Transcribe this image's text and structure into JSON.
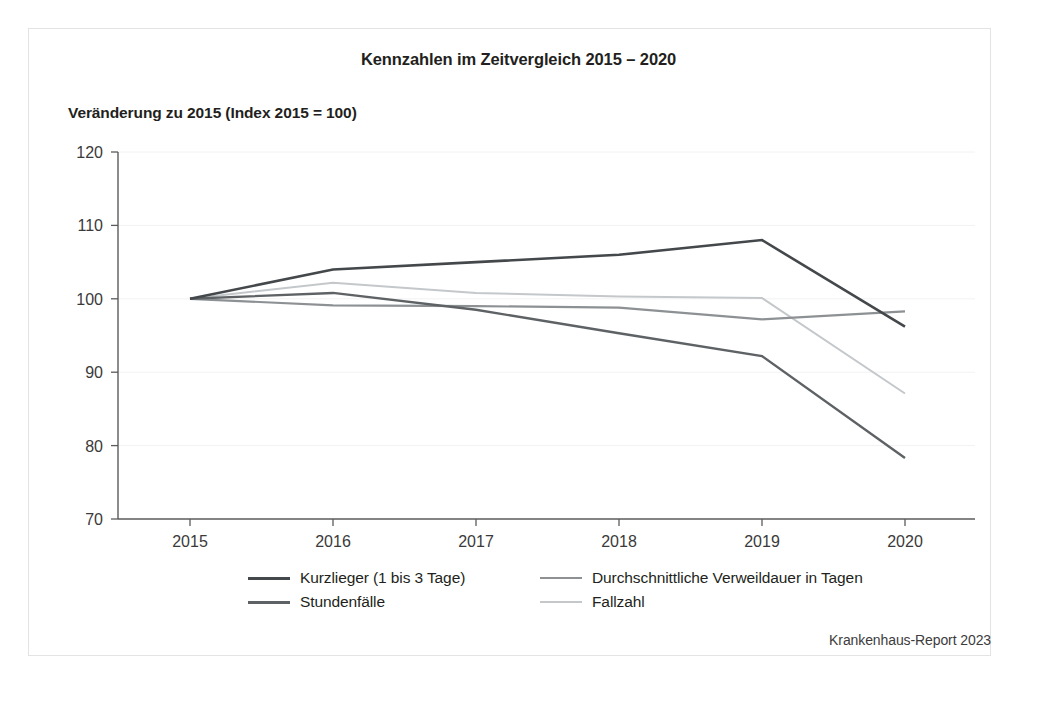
{
  "figure": {
    "title": "Kennzahlen im Zeitvergleich 2015 – 2020",
    "subtitle": "Veränderung zu 2015 (Index 2015 = 100)",
    "source_note": "Krankenhaus-Report 2023"
  },
  "chart_data": {
    "type": "line",
    "title": "Kennzahlen im Zeitvergleich 2015 – 2020",
    "subtitle": "Veränderung zu 2015 (Index 2015 = 100)",
    "xlabel": "",
    "ylabel": "Veränderung zu 2015 (Index 2015 = 100)",
    "x": [
      2015,
      2016,
      2017,
      2018,
      2019,
      2020
    ],
    "categories": [
      "2015",
      "2016",
      "2017",
      "2018",
      "2019",
      "2020"
    ],
    "xtick_labels": [
      "2015",
      "2016",
      "2017",
      "2018",
      "2019",
      "2020"
    ],
    "ytick_labels": [
      "70",
      "80",
      "90",
      "100",
      "110",
      "120"
    ],
    "yticks": [
      70,
      80,
      90,
      100,
      110,
      120
    ],
    "ylim": [
      70,
      120
    ],
    "xlim": [
      2015,
      2020
    ],
    "grid": true,
    "legend_position": "bottom",
    "series": [
      {
        "name": "Kurzlieger (1 bis 3 Tage)",
        "color": "#44484b",
        "width": 2.6,
        "dash": "none",
        "values": [
          100,
          104,
          105,
          106,
          108,
          96.2
        ]
      },
      {
        "name": "Stundenfälle",
        "color": "#5e6265",
        "width": 2.4,
        "dash": "none",
        "values": [
          100,
          100.8,
          98.5,
          95.3,
          92.2,
          78.3
        ]
      },
      {
        "name": "Durchschnittliche Verweildauer in Tagen",
        "color": "#8d9194",
        "width": 2.2,
        "dash": "none",
        "values": [
          100,
          99.1,
          99,
          98.8,
          97.2,
          98.3
        ]
      },
      {
        "name": "Fallzahl",
        "color": "#c4c8cb",
        "width": 2.0,
        "dash": "none",
        "values": [
          100,
          102.2,
          100.8,
          100.3,
          100.1,
          87.1
        ]
      }
    ]
  },
  "legend": {
    "entries": [
      {
        "label": "Kurzlieger (1 bis 3 Tage)",
        "color": "#44484b",
        "width": "3px",
        "column": "left",
        "row": 0
      },
      {
        "label": "Durchschnittliche Verweildauer in Tagen",
        "color": "#8d9194",
        "width": "2.5px",
        "column": "right",
        "row": 0
      },
      {
        "label": "Stundenfälle",
        "color": "#5e6265",
        "width": "3px",
        "column": "left",
        "row": 1
      },
      {
        "label": "Fallzahl",
        "color": "#c4c8cb",
        "width": "2.5px",
        "column": "right",
        "row": 1
      }
    ]
  },
  "axes": {
    "y_labels": [
      "120",
      "110",
      "100",
      "90",
      "80",
      "70"
    ],
    "x_labels": [
      "2015",
      "2016",
      "2017",
      "2018",
      "2019",
      "2020"
    ]
  }
}
